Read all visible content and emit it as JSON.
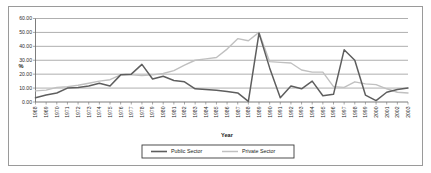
{
  "chart_data": {
    "type": "line",
    "title": "",
    "xlabel": "Year",
    "ylabel": "%",
    "ylim": [
      0,
      60
    ],
    "ytick_step": 10,
    "grid": true,
    "legend_position": "bottom",
    "ytick_labels": [
      "0.00",
      "10.00",
      "20.00",
      "30.00",
      "40.00",
      "50.00",
      "60.00"
    ],
    "categories": [
      "1968",
      "1969",
      "1970",
      "1971",
      "1972",
      "1973",
      "1974",
      "1975",
      "1976",
      "1977",
      "1978",
      "1979",
      "1980",
      "1981",
      "1982",
      "1983",
      "1984",
      "1985",
      "1986",
      "1987",
      "1988",
      "1989",
      "1990",
      "1991",
      "1992",
      "1993",
      "1994",
      "1995",
      "1996",
      "1997",
      "1998",
      "1999",
      "2000",
      "2001",
      "2002",
      "2003"
    ],
    "series": [
      {
        "name": "Public Sector",
        "color": "#5e5e5e",
        "values": [
          3.0,
          5.0,
          6.5,
          10.0,
          10.5,
          11.5,
          13.5,
          11.5,
          19.5,
          20.0,
          27.0,
          16.5,
          18.5,
          15.5,
          14.5,
          9.5,
          9.0,
          8.5,
          7.5,
          6.5,
          0.5,
          49.5,
          24.5,
          3.0,
          11.5,
          9.5,
          15.0,
          4.5,
          5.5,
          37.5,
          30.0,
          5.0,
          1.0,
          7.0,
          9.0,
          10.0
        ]
      },
      {
        "name": "Private Sector",
        "color": "#c0c0c0",
        "values": [
          8.0,
          8.5,
          10.5,
          11.0,
          12.0,
          13.5,
          15.0,
          16.0,
          19.5,
          19.5,
          19.0,
          19.5,
          20.5,
          22.5,
          26.5,
          30.0,
          31.0,
          32.0,
          38.0,
          45.5,
          44.0,
          50.0,
          29.0,
          28.5,
          28.0,
          23.0,
          21.5,
          21.5,
          11.0,
          10.5,
          14.5,
          13.0,
          12.5,
          9.5,
          7.0,
          6.5
        ]
      }
    ]
  },
  "legend": {
    "items": [
      {
        "label": "Public Sector"
      },
      {
        "label": "Private Sector"
      }
    ]
  }
}
